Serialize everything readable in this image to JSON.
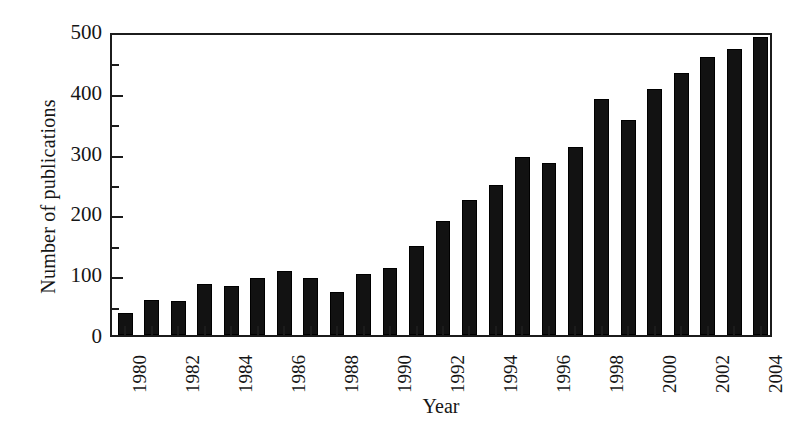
{
  "chart_data": {
    "type": "bar",
    "title": "",
    "xlabel": "Year",
    "ylabel": "Number of publications",
    "categories": [
      1980,
      1981,
      1982,
      1983,
      1984,
      1985,
      1986,
      1987,
      1988,
      1989,
      1990,
      1991,
      1992,
      1993,
      1994,
      1995,
      1996,
      1997,
      1998,
      1999,
      2000,
      2001,
      2002,
      2003,
      2004
    ],
    "values": [
      36,
      57,
      56,
      84,
      80,
      93,
      105,
      93,
      70,
      100,
      111,
      146,
      188,
      222,
      246,
      292,
      283,
      309,
      389,
      354,
      404,
      431,
      457,
      471,
      490
    ],
    "ylim": [
      0,
      500
    ],
    "ytick_major": [
      0,
      100,
      200,
      300,
      400,
      500
    ],
    "ytick_major_labels": [
      "0",
      "100",
      "200",
      "300",
      "400",
      "500"
    ],
    "ytick_minor": [
      50,
      150,
      250,
      350,
      450
    ],
    "xtick_labels_shown": [
      "1980",
      "1982",
      "1984",
      "1986",
      "1988",
      "1990",
      "1992",
      "1994",
      "1996",
      "1998",
      "2000",
      "2002",
      "2004"
    ],
    "grid": false,
    "legend": false,
    "bar_color": "#121212",
    "axis_color": "#1c1c1c",
    "background_color": "#ffffff",
    "xtick_label_rotation": -90
  }
}
